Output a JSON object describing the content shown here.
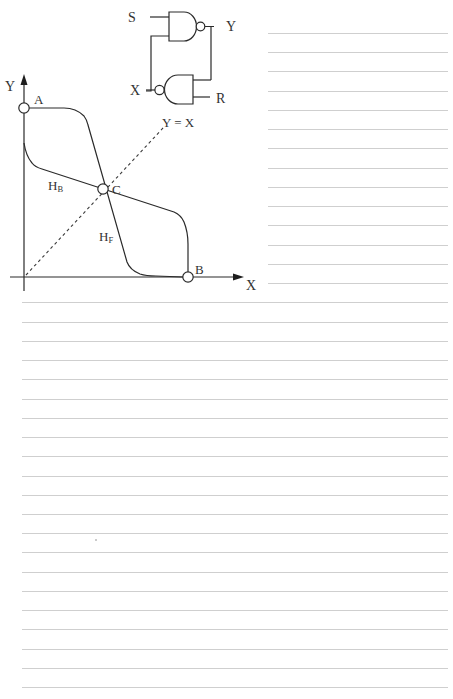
{
  "page": {
    "background": "#ffffff",
    "rule_color": "#cfcfcf",
    "ink_color": "#2a2a2a",
    "ruled_lines": {
      "first_y": 33,
      "spacing": 19.24,
      "count": 35,
      "short_x_start": 268,
      "full_x_start": 22,
      "x_end": 448,
      "short_until_y": 284
    },
    "stray_mark": {
      "x": 96,
      "y": 540
    }
  },
  "circuit": {
    "gates": [
      {
        "name": "top-nand",
        "type": "NAND",
        "bubble": "output"
      },
      {
        "name": "bottom-nand",
        "type": "NAND (reversed)",
        "bubble": "output-left"
      }
    ],
    "labels": {
      "s": "S",
      "y": "Y",
      "x": "X",
      "r": "R"
    }
  },
  "graph": {
    "axis_labels": {
      "y": "Y",
      "x": "X"
    },
    "points": {
      "a": "A",
      "b": "B",
      "c": "C"
    },
    "diagonal_label": "Y = X",
    "curves": {
      "hb": {
        "main": "H",
        "sub": "B"
      },
      "hf": {
        "main": "H",
        "sub": "F"
      }
    }
  }
}
